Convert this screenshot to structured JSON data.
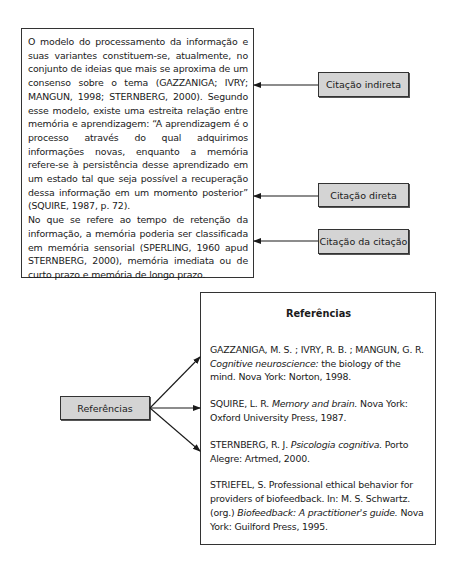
{
  "main_text": {
    "paragraph_1": "O modelo do processamento da informação e suas variantes constituem-se, atualmente, no conjunto de ideias que mais se aproxima de um consenso sobre o tema (GAZZANIGA; IVRY; MANGUN, 1998; STERNBERG, 2000). Segundo esse modelo, existe uma estreita relação entre memória e aprendizagem: “A aprendizagem é o processo através do qual adquirimos informações novas, enquanto a memória refere-se à persistência desse aprendizado em um estado tal que seja possível a recuperação dessa informação em um momento posterior” (SQUIRE, 1987, p. 72).",
    "paragraph_2": "No que se refere ao tempo de retenção da informação, a memória poderia ser classificada em memória sensorial (SPERLING, 1960 apud STERNBERG, 2000), memória imediata ou de curto prazo e memória de longo prazo."
  },
  "labels": {
    "indirect": "Citação indireta",
    "direct": "Citação direta",
    "citation_of_citation": "Citação da citação",
    "references": "Referências"
  },
  "references_box": {
    "title": "Referências",
    "entries": [
      {
        "pre": "GAZZANIGA, M. S. ; IVRY, R. B. ; MANGUN, G. R. ",
        "italic": "Cognitive neuroscience:",
        "post": "  the biology of the mind. Nova York: Norton, 1998."
      },
      {
        "pre": "SQUIRE, L. R. ",
        "italic": "Memory and brain.",
        "post": " Nova York: Oxford University Press, 1987."
      },
      {
        "pre": "STERNBERG, R. J. ",
        "italic": "Psicologia cognitiva.",
        "post": " Porto Alegre:  Artmed, 2000."
      },
      {
        "pre": "STRIEFEL, S. Professional ethical behavior for providers of biofeedback. In: M. S. Schwartz. (org.) ",
        "italic": "Biofeedback: A practitioner's guide.",
        "post": " Nova York: Guilford Press, 1995."
      }
    ]
  },
  "colors": {
    "label_fill": "#d4d4d4",
    "border": "#333333"
  }
}
